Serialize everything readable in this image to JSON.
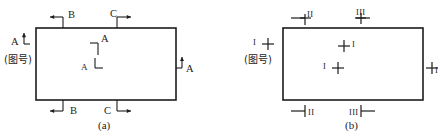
{
  "figure": {
    "title": "",
    "type": "engineering-drawing-section-marks",
    "background": "#ffffff",
    "line_color": "#1c1c1c",
    "text_color": "#1c1c1c"
  },
  "panels": [
    {
      "id": "a",
      "caption": "(a)",
      "tag_number": "(图号)",
      "style_note": "arrow-with-bracket section marks",
      "rect": {
        "x": 36,
        "y": 28,
        "w": 140,
        "h": 72
      },
      "marks": [
        {
          "name": "top-left-B",
          "label": "B",
          "direction": "left",
          "position": "top-edge"
        },
        {
          "name": "top-right-C",
          "label": "C",
          "direction": "right",
          "position": "top-edge"
        },
        {
          "name": "left-A",
          "label": "A",
          "direction": "up",
          "position": "left-edge"
        },
        {
          "name": "right-A",
          "label": "A",
          "direction": "up",
          "position": "right-edge"
        },
        {
          "name": "inner-upper-A",
          "label": "A",
          "direction": "up",
          "position": "interior"
        },
        {
          "name": "inner-lower-A",
          "label": "A",
          "direction": "down",
          "position": "interior"
        },
        {
          "name": "bottom-left-B",
          "label": "B",
          "direction": "left",
          "position": "bottom-edge"
        },
        {
          "name": "bottom-right-C",
          "label": "C",
          "direction": "right",
          "position": "bottom-edge"
        }
      ]
    },
    {
      "id": "b",
      "caption": "(b)",
      "tag_number": "(图号)",
      "style_note": "cross (plus) section marks with roman numerals",
      "rect": {
        "x": 63,
        "y": 28,
        "w": 140,
        "h": 72
      },
      "marks": [
        {
          "name": "top-left-II",
          "label": "II",
          "position": "top-edge"
        },
        {
          "name": "top-right-III",
          "label": "III",
          "position": "top-edge"
        },
        {
          "name": "left-I",
          "label": "I",
          "position": "left-edge"
        },
        {
          "name": "right-I",
          "label": "I",
          "position": "right-edge"
        },
        {
          "name": "inner-upper-I",
          "label": "I",
          "position": "interior"
        },
        {
          "name": "inner-lower-I",
          "label": "I",
          "position": "interior"
        },
        {
          "name": "bottom-left-II",
          "label": "II",
          "position": "bottom-edge"
        },
        {
          "name": "bottom-right-III",
          "label": "III",
          "position": "bottom-edge"
        }
      ]
    }
  ],
  "labels": {
    "a": {
      "caption": "(a)",
      "tagno": "(图号)",
      "top_b": "B",
      "top_c": "C",
      "left_a": "A",
      "right_a": "A",
      "inner_a_upper": "A",
      "inner_a_lower": "A",
      "bottom_b": "B",
      "bottom_c": "C"
    },
    "b": {
      "caption": "(b)",
      "tagno": "(图号)",
      "top_ii": "II",
      "top_iii": "III",
      "left_i": "I",
      "right_i": "I",
      "inner_i_upper": "I",
      "inner_i_lower": "I",
      "bottom_ii": "II",
      "bottom_iii": "III"
    }
  }
}
